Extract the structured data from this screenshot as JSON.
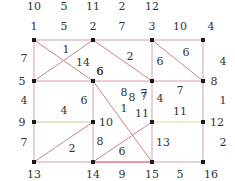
{
  "graph": {
    "title": "",
    "nodes": [
      {
        "id": "1",
        "x": 34,
        "y": 40,
        "lx": 34,
        "ly": 30
      },
      {
        "id": "2",
        "x": 93,
        "y": 40,
        "lx": 93,
        "ly": 30
      },
      {
        "id": "3",
        "x": 152,
        "y": 40,
        "lx": 152,
        "ly": 30
      },
      {
        "id": "4",
        "x": 203,
        "y": 40,
        "lx": 211,
        "ly": 30
      },
      {
        "id": "5",
        "x": 34,
        "y": 81,
        "lx": 22,
        "ly": 85
      },
      {
        "id": "6",
        "x": 93,
        "y": 81,
        "lx": 100,
        "ly": 75
      },
      {
        "id": "7",
        "x": 152,
        "y": 81,
        "lx": 144,
        "ly": 97
      },
      {
        "id": "8",
        "x": 203,
        "y": 81,
        "lx": 214,
        "ly": 85
      },
      {
        "id": "9",
        "x": 34,
        "y": 122,
        "lx": 22,
        "ly": 126
      },
      {
        "id": "10",
        "x": 93,
        "y": 122,
        "lx": 106,
        "ly": 126
      },
      {
        "id": "11",
        "x": 152,
        "y": 122,
        "lx": 142,
        "ly": 117
      },
      {
        "id": "12",
        "x": 203,
        "y": 122,
        "lx": 217,
        "ly": 126
      },
      {
        "id": "13",
        "x": 34,
        "y": 162,
        "lx": 34,
        "ly": 178
      },
      {
        "id": "14",
        "x": 93,
        "y": 162,
        "lx": 93,
        "ly": 178
      },
      {
        "id": "15",
        "x": 152,
        "y": 162,
        "lx": 152,
        "ly": 178
      },
      {
        "id": "16",
        "x": 203,
        "y": 162,
        "lx": 211,
        "ly": 178
      }
    ],
    "edges": [
      {
        "from": "1",
        "to": "2",
        "weight": "5",
        "color": "#d9a0a8",
        "lx": 64,
        "ly": 30
      },
      {
        "from": "2",
        "to": "3",
        "weight": "7",
        "color": "#d9a0a8",
        "lx": 122,
        "ly": 30
      },
      {
        "from": "3",
        "to": "4",
        "weight": "10",
        "color": "#d9a0a8",
        "lx": 180,
        "ly": 30
      },
      {
        "from": "1",
        "to": "5",
        "weight": "7",
        "color": "#d9a0a8",
        "lx": 24,
        "ly": 62
      },
      {
        "from": "1",
        "to": "6",
        "weight": "14",
        "color": "#c4868f",
        "lx": 83,
        "ly": 66
      },
      {
        "from": "2",
        "to": "5",
        "weight": "1",
        "color": "#c4868f",
        "lx": 66,
        "ly": 53
      },
      {
        "from": "2",
        "to": "7",
        "weight": "2",
        "color": "#c4868f",
        "lx": 130,
        "ly": 60
      },
      {
        "from": "3",
        "to": "7",
        "weight": "6",
        "color": "#d9a0a8",
        "lx": 160,
        "ly": 65
      },
      {
        "from": "3",
        "to": "8",
        "weight": "6",
        "color": "#c4868f",
        "lx": 186,
        "ly": 56
      },
      {
        "from": "4",
        "to": "8",
        "weight": "4",
        "color": "#d9a0a8",
        "lx": 223,
        "ly": 65
      },
      {
        "from": "5",
        "to": "6",
        "weight": "6",
        "color": "#d9a0a8",
        "lx": 100,
        "ly": 75
      },
      {
        "from": "6",
        "to": "7",
        "weight": "8",
        "color": "#d9a0a8",
        "lx": 124,
        "ly": 96
      },
      {
        "from": "7",
        "to": "8",
        "weight": "7",
        "color": "#d9a0a8",
        "lx": 180,
        "ly": 94
      },
      {
        "from": "5",
        "to": "9",
        "weight": "4",
        "color": "#d9a0a8",
        "lx": 24,
        "ly": 104
      },
      {
        "from": "6",
        "to": "10",
        "weight": "6",
        "color": "#d9a0a8",
        "lx": 84,
        "ly": 104
      },
      {
        "from": "6",
        "to": "15",
        "weight": "1",
        "color": "#c4868f",
        "lx": 124,
        "ly": 112
      },
      {
        "from": "7",
        "to": "11",
        "weight": "4",
        "color": "#d9a0a8",
        "lx": 160,
        "ly": 102
      },
      {
        "from": "8",
        "to": "12",
        "weight": "1",
        "color": "#d9a0a8",
        "lx": 223,
        "ly": 104
      },
      {
        "from": "9",
        "to": "10",
        "weight": "4",
        "color": "#c8c890",
        "lx": 64,
        "ly": 114
      },
      {
        "from": "11",
        "to": "12",
        "weight": "11",
        "color": "#d0e090",
        "lx": 180,
        "ly": 115
      },
      {
        "from": "9",
        "to": "13",
        "weight": "7",
        "color": "#d9a0a8",
        "lx": 24,
        "ly": 146
      },
      {
        "from": "10",
        "to": "13",
        "weight": "2",
        "color": "#c4868f",
        "lx": 72,
        "ly": 152
      },
      {
        "from": "10",
        "to": "14",
        "weight": "8",
        "color": "#d9a0a8",
        "lx": 100,
        "ly": 145
      },
      {
        "from": "11",
        "to": "14",
        "weight": "6",
        "color": "#c4868f",
        "lx": 122,
        "ly": 155
      },
      {
        "from": "11",
        "to": "15",
        "weight": "13",
        "color": "#d9a0a8",
        "lx": 163,
        "ly": 146
      },
      {
        "from": "12",
        "to": "16",
        "weight": "2",
        "color": "#d9a0a8",
        "lx": 223,
        "ly": 146
      },
      {
        "from": "13",
        "to": "14",
        "weight": "",
        "color": "#d9a0a8",
        "lx": 0,
        "ly": 0
      },
      {
        "from": "14",
        "to": "15",
        "weight": "9",
        "color": "#e8708a",
        "lx": 122,
        "ly": 178
      },
      {
        "from": "15",
        "to": "16",
        "weight": "5",
        "color": "#d9a0a8",
        "lx": 180,
        "ly": 178
      }
    ],
    "extra_labels": [
      {
        "text": "10",
        "x": 34,
        "y": 10
      },
      {
        "text": "5",
        "x": 64,
        "y": 10
      },
      {
        "text": "11",
        "x": 93,
        "y": 10
      },
      {
        "text": "2",
        "x": 122,
        "y": 10
      },
      {
        "text": "12",
        "x": 152,
        "y": 10
      },
      {
        "text": "8",
        "x": 132,
        "y": 101
      },
      {
        "text": "7",
        "x": 144,
        "y": 100
      }
    ]
  }
}
